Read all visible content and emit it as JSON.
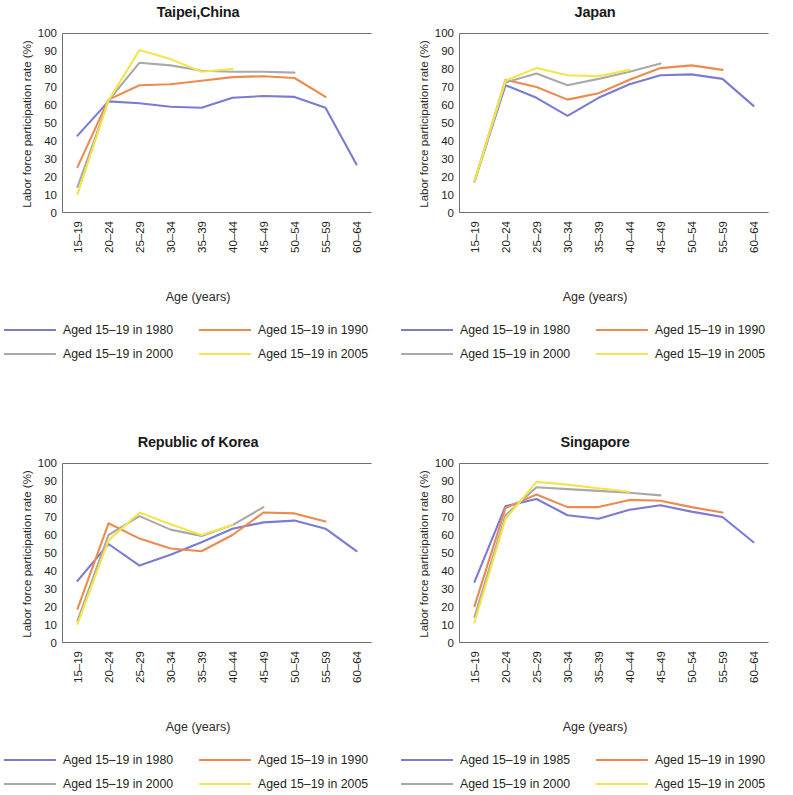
{
  "figure": {
    "axis_label_x": "Age (years)",
    "axis_label_y": "Labor force participation rate (%)",
    "categories": [
      "15–19",
      "20–24",
      "25–29",
      "30–34",
      "35–39",
      "40–44",
      "45–49",
      "50–54",
      "55–59",
      "60–64"
    ],
    "y_ticks": [
      "0",
      "10",
      "20",
      "30",
      "40",
      "50",
      "60",
      "70",
      "80",
      "90",
      "100"
    ],
    "colors": {
      "blue": "#7b7bd2",
      "orange": "#ed8a4e",
      "gray": "#a9a9a9",
      "yellow": "#f2e54c",
      "axis": "#6e6e6e",
      "text": "#231f20"
    }
  },
  "chart_data": [
    {
      "type": "line",
      "title": "Taipei,China",
      "xlabel": "Age (years)",
      "ylabel": "Labor force participation rate (%)",
      "ylim": [
        0,
        100
      ],
      "grid": false,
      "legend_position": "below",
      "categories": [
        "15–19",
        "20–24",
        "25–29",
        "30–34",
        "35–39",
        "40–44",
        "45–49",
        "50–54",
        "55–59",
        "60–64"
      ],
      "series": [
        {
          "name": "Aged 15–19 in 1980",
          "color": "#7b7bd2",
          "values": [
            43,
            62,
            61,
            59,
            58.5,
            64,
            65,
            64.5,
            58.5,
            27
          ]
        },
        {
          "name": "Aged 15–19 in 1990",
          "color": "#ed8a4e",
          "values": [
            25.5,
            63,
            71,
            71.5,
            73.5,
            75.5,
            76,
            75,
            64.5,
            null
          ]
        },
        {
          "name": "Aged 15–19 in 2000",
          "color": "#a9a9a9",
          "values": [
            14.5,
            62.5,
            83.5,
            82,
            79,
            78.5,
            78.5,
            78,
            null,
            null
          ]
        },
        {
          "name": "Aged 15–19 in 2005",
          "color": "#f2e54c",
          "values": [
            10.5,
            62.5,
            90.5,
            85.5,
            78.5,
            80,
            null,
            null,
            null,
            null
          ]
        }
      ]
    },
    {
      "type": "line",
      "title": "Japan",
      "xlabel": "Age (years)",
      "ylabel": "Labor force participation rate (%)",
      "ylim": [
        0,
        100
      ],
      "grid": false,
      "legend_position": "below",
      "categories": [
        "15–19",
        "20–24",
        "25–29",
        "30–34",
        "35–39",
        "40–44",
        "45–49",
        "50–54",
        "55–59",
        "60–64"
      ],
      "series": [
        {
          "name": "Aged 15–19 in 1980",
          "color": "#7b7bd2",
          "values": [
            17.5,
            71,
            64,
            54,
            64,
            71.5,
            76.5,
            77,
            74.5,
            59.5
          ]
        },
        {
          "name": "Aged 15–19 in 1990",
          "color": "#ed8a4e",
          "values": [
            17.5,
            74,
            70,
            63,
            66.5,
            74,
            80.5,
            82,
            79.5,
            null
          ]
        },
        {
          "name": "Aged 15–19 in 2000",
          "color": "#a9a9a9",
          "values": [
            17.5,
            72.5,
            77.5,
            71,
            74.5,
            78.5,
            83,
            null,
            null,
            null
          ]
        },
        {
          "name": "Aged 15–19 in 2005",
          "color": "#f2e54c",
          "values": [
            17.5,
            73.5,
            80.5,
            76.5,
            76,
            79.5,
            null,
            null,
            null,
            null
          ]
        }
      ]
    },
    {
      "type": "line",
      "title": "Republic of Korea",
      "xlabel": "Age (years)",
      "ylabel": "Labor force participation rate (%)",
      "ylim": [
        0,
        100
      ],
      "grid": false,
      "legend_position": "below",
      "categories": [
        "15–19",
        "20–24",
        "25–29",
        "30–34",
        "35–39",
        "40–44",
        "45–49",
        "50–54",
        "55–59",
        "60–64"
      ],
      "series": [
        {
          "name": "Aged 15–19 in 1980",
          "color": "#7b7bd2",
          "values": [
            34.5,
            55,
            43,
            49,
            56,
            63.5,
            67,
            68,
            63.5,
            51
          ]
        },
        {
          "name": "Aged 15–19 in 1990",
          "color": "#ed8a4e",
          "values": [
            19,
            66.5,
            58,
            52.5,
            51,
            60,
            72.5,
            72,
            67.5,
            null
          ]
        },
        {
          "name": "Aged 15–19 in 2000",
          "color": "#a9a9a9",
          "values": [
            12.5,
            60,
            70.5,
            63,
            59.5,
            65.5,
            75.5,
            null,
            null,
            null
          ]
        },
        {
          "name": "Aged 15–19 in 2005",
          "color": "#f2e54c",
          "values": [
            10.5,
            57,
            72.5,
            66,
            60,
            65.5,
            null,
            null,
            null,
            null
          ]
        }
      ]
    },
    {
      "type": "line",
      "title": "Singapore",
      "xlabel": "Age (years)",
      "ylabel": "Labor force participation rate (%)",
      "ylim": [
        0,
        100
      ],
      "grid": false,
      "legend_position": "below",
      "categories": [
        "15–19",
        "20–24",
        "25–29",
        "30–34",
        "35–39",
        "40–44",
        "45–49",
        "50–54",
        "55–59",
        "60–64"
      ],
      "series": [
        {
          "name": "Aged 15–19 in 1985",
          "color": "#7b7bd2",
          "values": [
            34,
            76,
            80,
            71,
            69,
            74,
            76.5,
            73,
            70,
            56
          ]
        },
        {
          "name": "Aged 15–19 in 1990",
          "color": "#ed8a4e",
          "values": [
            20.5,
            75,
            82.5,
            75.5,
            75.5,
            79.5,
            79,
            75.5,
            72.5,
            null
          ]
        },
        {
          "name": "Aged 15–19 in 2000",
          "color": "#a9a9a9",
          "values": [
            14.5,
            71,
            86.5,
            85.5,
            84.5,
            83.5,
            82,
            null,
            null,
            null
          ]
        },
        {
          "name": "Aged 15–19 in 2005",
          "color": "#f2e54c",
          "values": [
            11.5,
            69,
            89.5,
            88,
            86,
            84,
            null,
            null,
            null,
            null
          ]
        }
      ]
    }
  ],
  "panels": [
    {
      "title": "Taipei,China",
      "legend": [
        {
          "label": "Aged 15–19 in 1980",
          "color": "#7b7bd2"
        },
        {
          "label": "Aged 15–19 in 1990",
          "color": "#ed8a4e"
        },
        {
          "label": "Aged 15–19 in 2000",
          "color": "#a9a9a9"
        },
        {
          "label": "Aged 15–19 in 2005",
          "color": "#f2e54c"
        }
      ]
    },
    {
      "title": "Japan",
      "legend": [
        {
          "label": "Aged 15–19 in 1980",
          "color": "#7b7bd2"
        },
        {
          "label": "Aged 15–19 in 1990",
          "color": "#ed8a4e"
        },
        {
          "label": "Aged 15–19 in 2000",
          "color": "#a9a9a9"
        },
        {
          "label": "Aged 15–19 in 2005",
          "color": "#f2e54c"
        }
      ]
    },
    {
      "title": "Republic of Korea",
      "legend": [
        {
          "label": "Aged 15–19 in 1980",
          "color": "#7b7bd2"
        },
        {
          "label": "Aged 15–19 in 1990",
          "color": "#ed8a4e"
        },
        {
          "label": "Aged 15–19 in 2000",
          "color": "#a9a9a9"
        },
        {
          "label": "Aged 15–19 in 2005",
          "color": "#f2e54c"
        }
      ]
    },
    {
      "title": "Singapore",
      "legend": [
        {
          "label": "Aged 15–19 in 1985",
          "color": "#7b7bd2"
        },
        {
          "label": "Aged 15–19 in 1990",
          "color": "#ed8a4e"
        },
        {
          "label": "Aged 15–19 in 2000",
          "color": "#a9a9a9"
        },
        {
          "label": "Aged 15–19 in 2005",
          "color": "#f2e54c"
        }
      ]
    }
  ]
}
